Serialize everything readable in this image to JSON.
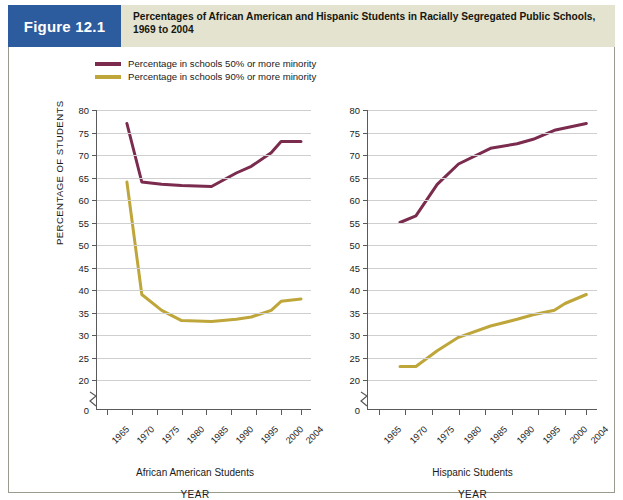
{
  "figure": {
    "badge": "Figure 12.1",
    "title_line1": "Percentages of African American and Hispanic Students in Racially Segregated Public Schools,",
    "title_line2": "1969 to 2004",
    "badge_color": "#2d5c9e",
    "header_color": "#e3e3cf"
  },
  "legend": {
    "position": "top-left",
    "items": [
      {
        "label": "Percentage in schools 50% or more minority",
        "color": "#7a2b4e"
      },
      {
        "label": "Percentage in schools 90% or more minority",
        "color": "#bfa63a"
      }
    ]
  },
  "axes": {
    "y_title": "PERCENTAGE OF STUDENTS",
    "x_title": "YEAR",
    "y_ticks": [
      80,
      75,
      70,
      65,
      60,
      55,
      50,
      45,
      40,
      35,
      30,
      25,
      20,
      0
    ],
    "y_min_plotted": 20,
    "y_max_plotted": 80,
    "y_break": true,
    "x_ticks": [
      "1965",
      "1970",
      "1975",
      "1980",
      "1985",
      "1990",
      "1995",
      "2000",
      "2004"
    ]
  },
  "panels": {
    "left_caption": "African American Students",
    "right_caption": "Hispanic Students"
  },
  "chart_data": [
    {
      "type": "line",
      "title": "African American Students",
      "xlabel": "YEAR",
      "ylabel": "PERCENTAGE OF STUDENTS",
      "ylim": [
        20,
        80
      ],
      "xlim": [
        1963,
        2006
      ],
      "grid": true,
      "legend_position": "top-left",
      "x_tick_labels": [
        "1965",
        "1970",
        "1975",
        "1980",
        "1985",
        "1990",
        "1995",
        "2000",
        "2004"
      ],
      "series": [
        {
          "name": "Percentage in schools 50% or more minority",
          "color": "#7a2b4e",
          "x": [
            1969,
            1972,
            1976,
            1980,
            1986,
            1991,
            1994,
            1998,
            2000,
            2004
          ],
          "values": [
            77,
            64,
            63.5,
            63.2,
            63,
            66,
            67.5,
            70.5,
            73,
            73
          ]
        },
        {
          "name": "Percentage in schools 90% or more minority",
          "color": "#bfa63a",
          "x": [
            1969,
            1972,
            1976,
            1980,
            1986,
            1991,
            1994,
            1998,
            2000,
            2004
          ],
          "values": [
            64,
            39,
            35.5,
            33.2,
            33,
            33.5,
            34,
            35.5,
            37.5,
            38
          ]
        }
      ]
    },
    {
      "type": "line",
      "title": "Hispanic Students",
      "xlabel": "YEAR",
      "ylabel": "PERCENTAGE OF STUDENTS",
      "ylim": [
        20,
        80
      ],
      "xlim": [
        1963,
        2006
      ],
      "grid": true,
      "legend_position": "top-left",
      "x_tick_labels": [
        "1965",
        "1970",
        "1975",
        "1980",
        "1985",
        "1990",
        "1995",
        "2000",
        "2004"
      ],
      "series": [
        {
          "name": "Percentage in schools 50% or more minority",
          "color": "#7a2b4e",
          "x": [
            1969,
            1972,
            1976,
            1980,
            1986,
            1991,
            1994,
            1998,
            2000,
            2004
          ],
          "values": [
            55,
            56.5,
            63.5,
            68,
            71.5,
            72.5,
            73.5,
            75.5,
            76,
            77
          ]
        },
        {
          "name": "Percentage in schools 90% or more minority",
          "color": "#bfa63a",
          "x": [
            1969,
            1972,
            1976,
            1980,
            1986,
            1991,
            1994,
            1998,
            2000,
            2004
          ],
          "values": [
            23,
            23,
            26.5,
            29.5,
            32,
            33.5,
            34.5,
            35.5,
            37,
            39
          ]
        }
      ]
    }
  ]
}
